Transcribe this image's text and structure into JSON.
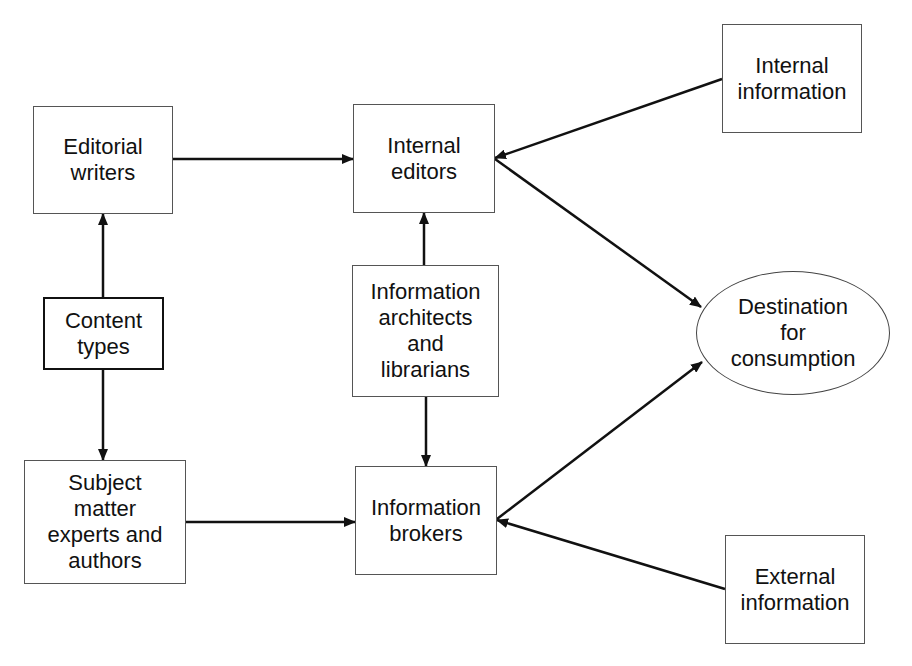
{
  "diagram": {
    "type": "flow-diagram",
    "nodes": [
      {
        "id": "editorial_writers",
        "label": "Editorial\nwriters",
        "shape": "rect",
        "x": 33,
        "y": 106,
        "w": 140,
        "h": 108
      },
      {
        "id": "content_types",
        "label": "Content\ntypes",
        "shape": "rect-bold",
        "x": 43,
        "y": 297,
        "w": 121,
        "h": 73
      },
      {
        "id": "subject_matter_experts",
        "label": "Subject\nmatter\nexperts and\nauthors",
        "shape": "rect",
        "x": 24,
        "y": 460,
        "w": 162,
        "h": 124
      },
      {
        "id": "internal_editors",
        "label": "Internal\neditors",
        "shape": "rect",
        "x": 353,
        "y": 104,
        "w": 142,
        "h": 109
      },
      {
        "id": "information_architects",
        "label": "Information\narchitects\nand\nlibrarians",
        "shape": "rect",
        "x": 352,
        "y": 265,
        "w": 147,
        "h": 132
      },
      {
        "id": "information_brokers",
        "label": "Information\nbrokers",
        "shape": "rect",
        "x": 355,
        "y": 466,
        "w": 142,
        "h": 109
      },
      {
        "id": "internal_information",
        "label": "Internal\ninformation",
        "shape": "rect",
        "x": 722,
        "y": 24,
        "w": 140,
        "h": 109
      },
      {
        "id": "destination",
        "label": "Destination\nfor\nconsumption",
        "shape": "ellipse",
        "x": 696,
        "y": 271,
        "w": 194,
        "h": 124
      },
      {
        "id": "external_information",
        "label": "External\ninformation",
        "shape": "rect",
        "x": 725,
        "y": 535,
        "w": 140,
        "h": 109
      }
    ],
    "edges": [
      {
        "from": "editorial_writers",
        "to": "internal_editors",
        "x1": 173,
        "y1": 159,
        "x2": 353,
        "y2": 159
      },
      {
        "from": "content_types",
        "to": "editorial_writers",
        "x1": 103,
        "y1": 297,
        "x2": 103,
        "y2": 214
      },
      {
        "from": "content_types",
        "to": "subject_matter_experts",
        "x1": 103,
        "y1": 370,
        "x2": 103,
        "y2": 460
      },
      {
        "from": "subject_matter_experts",
        "to": "information_brokers",
        "x1": 186,
        "y1": 522,
        "x2": 355,
        "y2": 522
      },
      {
        "from": "information_architects",
        "to": "internal_editors",
        "x1": 424,
        "y1": 265,
        "x2": 424,
        "y2": 213
      },
      {
        "from": "information_architects",
        "to": "information_brokers",
        "x1": 426,
        "y1": 397,
        "x2": 426,
        "y2": 466
      },
      {
        "from": "internal_information",
        "to": "internal_editors",
        "x1": 722,
        "y1": 79,
        "x2": 495,
        "y2": 158
      },
      {
        "from": "internal_editors",
        "to": "destination",
        "x1": 495,
        "y1": 159,
        "x2": 701,
        "y2": 307
      },
      {
        "from": "information_brokers",
        "to": "destination",
        "x1": 497,
        "y1": 519,
        "x2": 702,
        "y2": 362
      },
      {
        "from": "external_information",
        "to": "information_brokers",
        "x1": 725,
        "y1": 589,
        "x2": 497,
        "y2": 520
      }
    ],
    "colors": {
      "line": "#111111",
      "box_border": "#555555",
      "text": "#111111",
      "background": "#ffffff"
    }
  }
}
